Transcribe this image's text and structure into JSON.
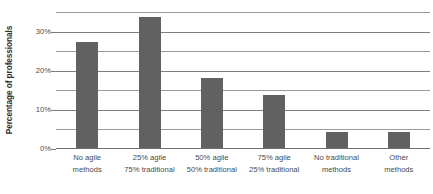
{
  "chart_data": {
    "type": "bar",
    "title": "",
    "xlabel": "",
    "ylabel": "Percentage of professionals",
    "categories": [
      "No agile methods",
      "25% agile 75% traditional",
      "50% agile 50% traditional",
      "75% agile 25% traditional",
      "No traditional methods",
      "Other methods"
    ],
    "category_lines": [
      [
        "No agile",
        "methods"
      ],
      [
        "25% agile",
        "75% traditional"
      ],
      [
        "50% agile",
        "50% traditional"
      ],
      [
        "75% agile",
        "25% traditional"
      ],
      [
        "No traditional",
        "methods"
      ],
      [
        "Other",
        "methods"
      ]
    ],
    "values": [
      27,
      33.5,
      18,
      13.5,
      4,
      4
    ],
    "value_labels": [
      "27%",
      "33.5%",
      "18%",
      "13.5%",
      "4%",
      "4%"
    ],
    "ylim": [
      0,
      35
    ],
    "ytick_values": [
      0,
      10,
      20,
      30
    ],
    "ytick_labels": [
      "0%",
      "10%",
      "20%",
      "30%"
    ],
    "minor_gridline_values": [
      5,
      15,
      25,
      35
    ],
    "grid": true,
    "legend": null,
    "bar_color": "#616161",
    "gridline_color": "#8c8c8c",
    "axis_color": "#6f6f6f",
    "text_color": "#4a4a4a"
  }
}
